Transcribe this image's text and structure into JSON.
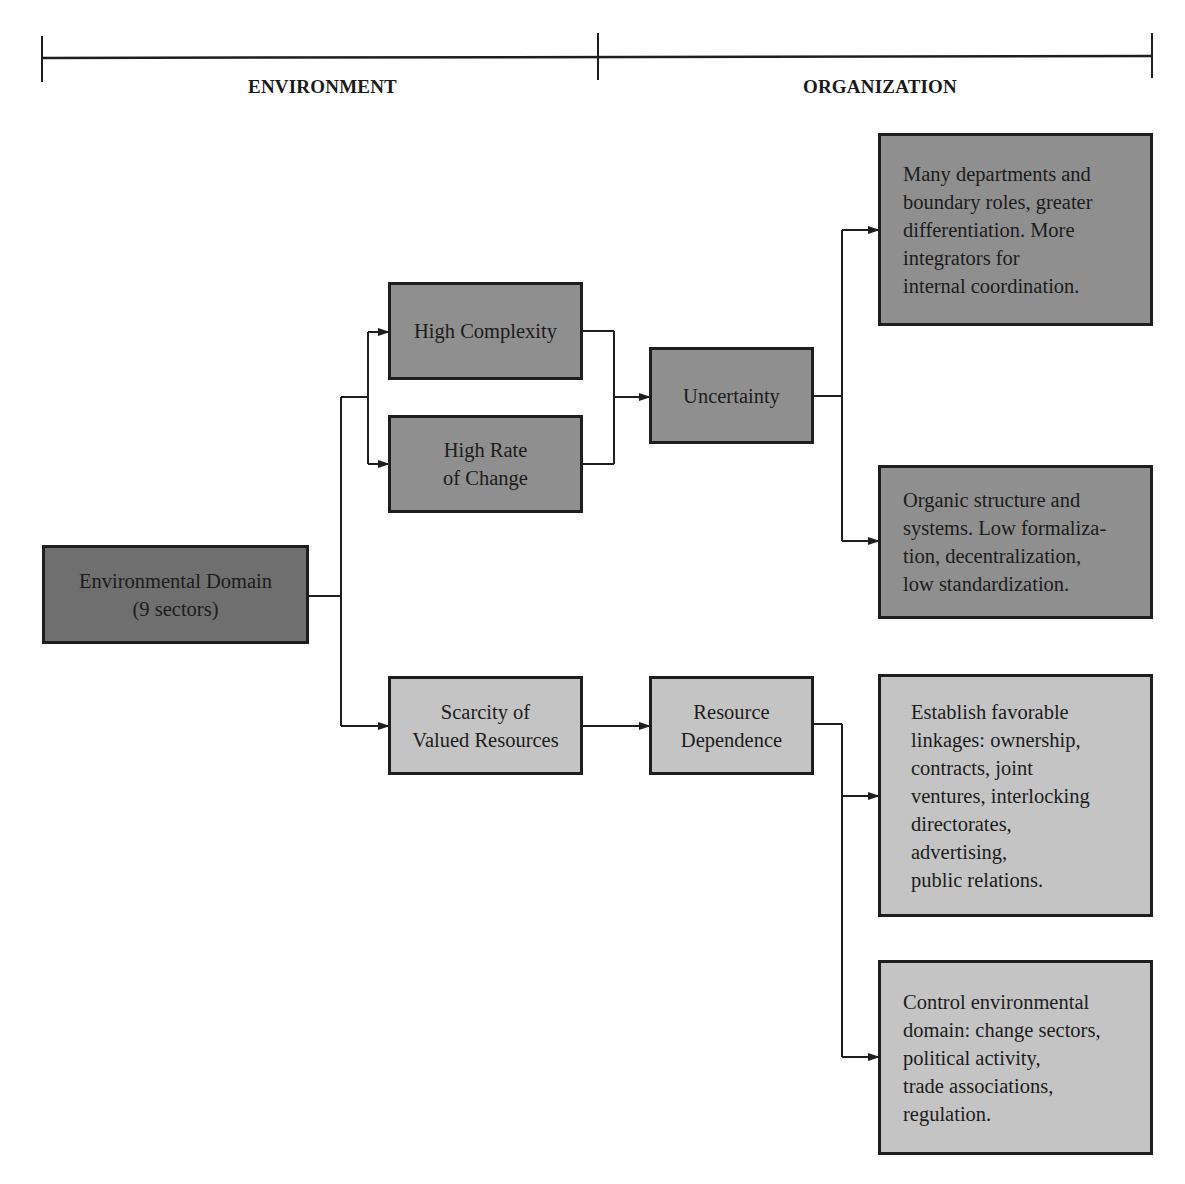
{
  "header": {
    "environment_label": "ENVIRONMENT",
    "organization_label": "ORGANIZATION"
  },
  "colors": {
    "dark_box": "#6f6f6f",
    "mid_box": "#8f8f8f",
    "light_box": "#c4c4c4",
    "line": "#1e1e1e"
  },
  "nodes": {
    "environmental_domain": "Environmental Domain\n(9 sectors)",
    "high_complexity": "High Complexity",
    "high_rate_of_change": "High Rate\nof Change",
    "scarcity": "Scarcity of\nValued Resources",
    "uncertainty": "Uncertainty",
    "resource_dependence": "Resource\nDependence",
    "outcome_departments": "Many departments and\nboundary roles, greater\ndifferentiation. More\nintegrators for\ninternal coordination.",
    "outcome_organic": "Organic structure and\nsystems. Low formaliza-\ntion, decentralization,\nlow standardization.",
    "outcome_linkages": "Establish favorable\nlinkages: ownership,\ncontracts, joint\nventures, interlocking\ndirectorates,\nadvertising,\npublic relations.",
    "outcome_control": "Control environmental\ndomain: change sectors,\npolitical activity,\ntrade associations,\nregulation."
  },
  "edges": [
    {
      "from": "Environmental Domain",
      "to": "High Complexity"
    },
    {
      "from": "Environmental Domain",
      "to": "High Rate of Change"
    },
    {
      "from": "Environmental Domain",
      "to": "Scarcity of Valued Resources"
    },
    {
      "from": "High Complexity",
      "to": "Uncertainty"
    },
    {
      "from": "High Rate of Change",
      "to": "Uncertainty"
    },
    {
      "from": "Uncertainty",
      "to": "Many departments and boundary roles"
    },
    {
      "from": "Uncertainty",
      "to": "Organic structure and systems"
    },
    {
      "from": "Scarcity of Valued Resources",
      "to": "Resource Dependence"
    },
    {
      "from": "Resource Dependence",
      "to": "Establish favorable linkages"
    },
    {
      "from": "Resource Dependence",
      "to": "Control environmental domain"
    }
  ]
}
